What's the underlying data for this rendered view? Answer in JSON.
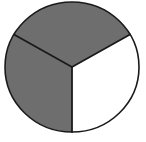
{
  "figure": {
    "name": "pie-chart-thirds",
    "background_color": "#ffffff",
    "width": 146,
    "height": 142
  },
  "chart_data": {
    "type": "pie",
    "title": "",
    "subtitle": "",
    "xlabel": "",
    "ylabel": "",
    "grid": false,
    "legend": "none",
    "annotations": [],
    "tick_labels": [],
    "total": 3,
    "units": "thirds",
    "center": {
      "cx": 72,
      "cy": 67
    },
    "radius": {
      "rx": 67,
      "ry": 65
    },
    "start_angle_deg": 90,
    "direction": "clockwise",
    "stroke_color": "#1a1a1a",
    "stroke_width": 1.6,
    "categories": [
      "Shaded sector 1",
      "Shaded sector 2",
      "Unshaded sector"
    ],
    "values": [
      1,
      1,
      1
    ],
    "percentages": [
      "33.3%",
      "33.3%",
      "33.3%"
    ],
    "angles_deg": [
      120,
      120,
      120
    ],
    "slices": [
      {
        "label": "Shaded sector 1",
        "position": "upper",
        "value": 1,
        "fraction": "1/3",
        "percent": "33.3%",
        "angle_deg": 120,
        "start_deg": 210,
        "end_deg": 330,
        "fill": "#6e6e6e",
        "shaded": true
      },
      {
        "label": "Shaded sector 2",
        "position": "left",
        "value": 1,
        "fraction": "1/3",
        "percent": "33.3%",
        "angle_deg": 120,
        "start_deg": 90,
        "end_deg": 210,
        "fill": "#6e6e6e",
        "shaded": true
      },
      {
        "label": "Unshaded sector",
        "position": "lower-right",
        "value": 1,
        "fraction": "1/3",
        "percent": "33.3%",
        "angle_deg": 120,
        "start_deg": 330,
        "end_deg": 450,
        "fill": "#ffffff",
        "shaded": false
      }
    ]
  }
}
